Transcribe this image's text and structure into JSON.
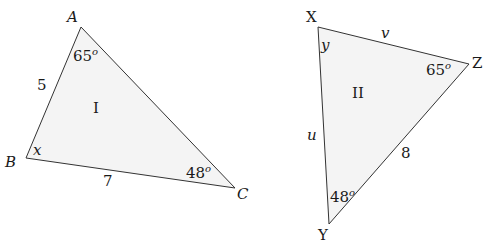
{
  "diagram": {
    "type": "two triangles",
    "triangles": [
      {
        "id": "I",
        "label": "I",
        "vertices": [
          {
            "name": "A",
            "x": 81,
            "y": 27
          },
          {
            "name": "B",
            "x": 26,
            "y": 158
          },
          {
            "name": "C",
            "x": 235,
            "y": 188
          }
        ],
        "angles": {
          "A": "65°",
          "B": "x",
          "C": "48°"
        },
        "sides": {
          "AB": "5",
          "BC": "7"
        }
      },
      {
        "id": "II",
        "label": "II",
        "vertices": [
          {
            "name": "X",
            "x": 318,
            "y": 27
          },
          {
            "name": "Y",
            "x": 329,
            "y": 224
          },
          {
            "name": "Z",
            "x": 469,
            "y": 64
          }
        ],
        "angles": {
          "X": "y",
          "Y": "48°",
          "Z": "65°"
        },
        "sides": {
          "XZ": "v",
          "XY": "u",
          "YZ": "8"
        }
      }
    ]
  },
  "t1": {
    "A": "A",
    "B": "B",
    "C": "C",
    "angleA": "65",
    "angleB": "x",
    "angleC": "48",
    "sideAB": "5",
    "sideBC": "7",
    "name": "I",
    "deg": "o"
  },
  "t2": {
    "X": "X",
    "Y": "Y",
    "Z": "Z",
    "angleX": "y",
    "angleY": "48",
    "angleZ": "65",
    "sideXZ": "v",
    "sideXY": "u",
    "sideYZ": "8",
    "name": "II",
    "deg": "o"
  }
}
